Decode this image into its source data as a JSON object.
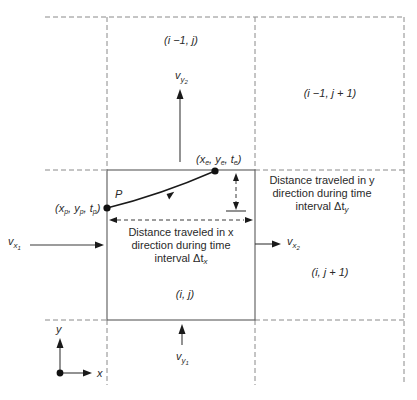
{
  "cells": {
    "top": "(i −1, j)",
    "top_right": "(i −1, j + 1)",
    "center": "(i, j)",
    "right": "(i, j + 1)"
  },
  "velocities": {
    "vy2": {
      "base": "v",
      "sub": "y",
      "subsub": "2"
    },
    "vx1": {
      "base": "v",
      "sub": "x",
      "subsub": "1"
    },
    "vx2": {
      "base": "v",
      "sub": "x",
      "subsub": "2"
    },
    "vy1": {
      "base": "v",
      "sub": "y",
      "subsub": "1"
    }
  },
  "points": {
    "p_label": "P",
    "start": {
      "open": "(x",
      "xsub": "p",
      "mid1": ", y",
      "ysub": "p",
      "mid2": ", t",
      "tsub": "p",
      "close": ")"
    },
    "end": {
      "open": "(x",
      "xsub": "e",
      "mid1": ", y",
      "ysub": "e",
      "mid2": ", t",
      "tsub": "e",
      "close": ")"
    }
  },
  "annotations": {
    "x_distance": {
      "line1": "Distance traveled in x",
      "line2": "direction during time",
      "line3_prefix": "interval Δt",
      "line3_sub": "x"
    },
    "y_distance": {
      "line1": "Distance traveled in y",
      "line2": "direction during time",
      "line3_prefix": "interval Δt",
      "line3_sub": "y"
    }
  },
  "axes": {
    "x_label": "x",
    "y_label": "y"
  }
}
